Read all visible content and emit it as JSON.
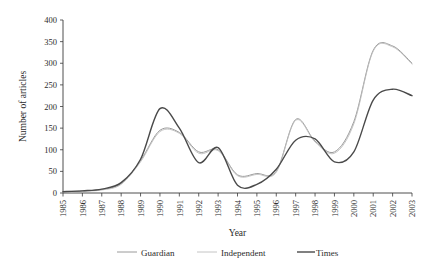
{
  "chart_data": {
    "type": "line",
    "title": "",
    "xlabel": "Year",
    "ylabel": "Number of articles",
    "xlim": [
      1985,
      2003
    ],
    "ylim": [
      0,
      400
    ],
    "ytick_step": 50,
    "grid": false,
    "legend_position": "bottom",
    "categories": [
      1985,
      1986,
      1987,
      1988,
      1989,
      1990,
      1991,
      1992,
      1993,
      1994,
      1995,
      1996,
      1997,
      1998,
      1999,
      2000,
      2001,
      2002,
      2003
    ],
    "x_tick_labels": [
      "1985",
      "1986",
      "1987",
      "1988",
      "1989",
      "1990",
      "1991",
      "1992",
      "1993",
      "1994",
      "1995",
      "1996",
      "1997",
      "1998",
      "1999",
      "2000",
      "2001",
      "2002",
      "2003"
    ],
    "y_tick_labels": [
      "0",
      "50",
      "100",
      "150",
      "200",
      "250",
      "300",
      "350",
      "400"
    ],
    "series": [
      {
        "name": "Guardian",
        "color": "#9a9a9a",
        "width": 1.0,
        "values": [
          3,
          5,
          8,
          22,
          75,
          145,
          140,
          95,
          100,
          42,
          45,
          50,
          170,
          120,
          95,
          165,
          330,
          340,
          300
        ]
      },
      {
        "name": "Independent",
        "color": "#bdbdbd",
        "width": 0.9,
        "values": [
          2,
          4,
          7,
          20,
          72,
          142,
          138,
          92,
          98,
          40,
          43,
          48,
          168,
          118,
          92,
          160,
          328,
          338,
          298
        ]
      },
      {
        "name": "Times",
        "color": "#4a4a4a",
        "width": 1.4,
        "values": [
          3,
          5,
          9,
          24,
          78,
          195,
          150,
          70,
          105,
          18,
          20,
          55,
          122,
          125,
          72,
          95,
          215,
          240,
          225
        ]
      }
    ]
  },
  "legend": {
    "entries": [
      {
        "label": "Guardian"
      },
      {
        "label": "Independent"
      },
      {
        "label": "Times"
      }
    ]
  }
}
